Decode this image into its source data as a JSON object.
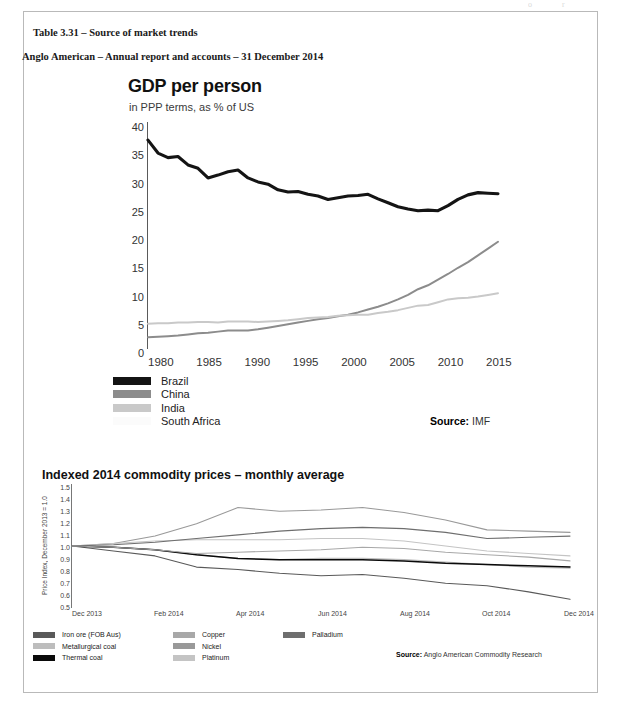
{
  "page": {
    "top_faint_marks": "o  r",
    "caption_table": "Table 3.31 – Source of market trends",
    "caption_report": "Anglo American – Annual report and accounts – 31 December 2014"
  },
  "gdp_chart": {
    "title": "GDP per person",
    "subtitle": "in PPP terms, as % of US",
    "source_label": "Source:",
    "source_value": "IMF",
    "legend": [
      {
        "label": "Brazil",
        "color": "#141414"
      },
      {
        "label": "China",
        "color": "#8c8c8c"
      },
      {
        "label": "India",
        "color": "#c9c9c9"
      },
      {
        "label": "South Africa",
        "color": "#fbfbfb"
      }
    ]
  },
  "commodity_chart": {
    "title": "Indexed 2014 commodity prices – monthly average",
    "ylabel": "Price Index, December 2013 = 1.0",
    "source_label": "Source:",
    "source_value": "Anglo American Commodity Research",
    "legend_col1": [
      {
        "label": "Iron ore (FOB Aus)",
        "color": "#595959"
      },
      {
        "label": "Metallurgical coal",
        "color": "#bdbdbd"
      },
      {
        "label": "Thermal coal",
        "color": "#0a0a0a"
      }
    ],
    "legend_col2": [
      {
        "label": "Copper",
        "color": "#a8a8a8"
      },
      {
        "label": "Nickel",
        "color": "#999999"
      },
      {
        "label": "Platinum",
        "color": "#c4c4c4"
      }
    ],
    "legend_col3": [
      {
        "label": "Palladium",
        "color": "#6e6e6e"
      }
    ]
  },
  "chart_data": [
    {
      "type": "line",
      "id": "gdp-per-person",
      "title": "GDP per person",
      "subtitle": "in PPP terms, as % of US",
      "xlabel": "",
      "ylabel": "% of US (PPP terms)",
      "ylim": [
        0,
        40
      ],
      "yticks": [
        0,
        5,
        10,
        15,
        20,
        25,
        30,
        35,
        40
      ],
      "xlim": [
        1980,
        2015
      ],
      "xticks": [
        1980,
        1985,
        1990,
        1995,
        2000,
        2005,
        2010,
        2015
      ],
      "grid": false,
      "legend_position": "below-left",
      "source": "IMF",
      "x": [
        1980,
        1981,
        1982,
        1983,
        1984,
        1985,
        1986,
        1987,
        1988,
        1989,
        1990,
        1991,
        1992,
        1993,
        1994,
        1995,
        1996,
        1997,
        1998,
        1999,
        2000,
        2001,
        2002,
        2003,
        2004,
        2005,
        2006,
        2007,
        2008,
        2009,
        2010,
        2011,
        2012,
        2013,
        2014,
        2015
      ],
      "series": [
        {
          "name": "Brazil",
          "color": "#141414",
          "values": [
            36.8,
            34.5,
            33.7,
            33.9,
            32.4,
            31.8,
            30.1,
            30.6,
            31.2,
            31.5,
            30.1,
            29.4,
            29.0,
            28.0,
            27.6,
            27.7,
            27.2,
            26.9,
            26.3,
            26.6,
            26.9,
            27.0,
            27.2,
            26.4,
            25.7,
            25.0,
            24.6,
            24.3,
            24.4,
            24.3,
            25.2,
            26.3,
            27.1,
            27.5,
            27.4,
            27.3
          ]
        },
        {
          "name": "China",
          "color": "#8c8c8c",
          "values": [
            1.9,
            2.0,
            2.1,
            2.2,
            2.4,
            2.6,
            2.7,
            2.9,
            3.1,
            3.1,
            3.1,
            3.3,
            3.6,
            3.9,
            4.2,
            4.5,
            4.8,
            5.1,
            5.3,
            5.6,
            5.9,
            6.3,
            6.8,
            7.3,
            7.9,
            8.6,
            9.4,
            10.4,
            11.1,
            12.1,
            13.1,
            14.2,
            15.2,
            16.4,
            17.6,
            18.8
          ]
        },
        {
          "name": "India",
          "color": "#c9c9c9",
          "values": [
            4.3,
            4.4,
            4.4,
            4.5,
            4.5,
            4.6,
            4.6,
            4.5,
            4.7,
            4.7,
            4.7,
            4.6,
            4.7,
            4.8,
            4.9,
            5.1,
            5.3,
            5.4,
            5.5,
            5.7,
            5.8,
            5.9,
            5.9,
            6.2,
            6.4,
            6.7,
            7.1,
            7.5,
            7.6,
            8.1,
            8.6,
            8.8,
            8.9,
            9.1,
            9.4,
            9.7
          ]
        },
        {
          "name": "South Africa",
          "color": "#fbfbfb",
          "values": [
            null,
            null,
            null,
            null,
            null,
            null,
            null,
            null,
            null,
            null,
            null,
            null,
            null,
            null,
            null,
            null,
            null,
            null,
            null,
            null,
            null,
            null,
            null,
            null,
            null,
            null,
            null,
            null,
            null,
            null,
            null,
            null,
            null,
            null,
            null,
            null
          ]
        }
      ]
    },
    {
      "type": "line",
      "id": "indexed-2014-commodity-prices",
      "title": "Indexed 2014 commodity prices – monthly average",
      "xlabel": "",
      "ylabel": "Price Index, December 2013 = 1.0",
      "ylim": [
        0.5,
        1.5
      ],
      "yticks": [
        0.5,
        0.6,
        0.7,
        0.8,
        0.9,
        1.0,
        1.1,
        1.2,
        1.3,
        1.4,
        1.5
      ],
      "xticks": [
        "Dec 2013",
        "Feb 2014",
        "Apr 2014",
        "Jun 2014",
        "Aug 2014",
        "Oct 2014",
        "Dec 2014"
      ],
      "x": [
        "Dec 2013",
        "Jan 2014",
        "Feb 2014",
        "Mar 2014",
        "Apr 2014",
        "May 2014",
        "Jun 2014",
        "Jul 2014",
        "Aug 2014",
        "Sep 2014",
        "Oct 2014",
        "Nov 2014",
        "Dec 2014"
      ],
      "grid": false,
      "legend_position": "below-left",
      "source": "Anglo American Commodity Research",
      "series": [
        {
          "name": "Iron ore (FOB Aus)",
          "color": "#595959",
          "values": [
            1.0,
            0.96,
            0.92,
            0.83,
            0.81,
            0.78,
            0.76,
            0.77,
            0.74,
            0.7,
            0.68,
            0.63,
            0.57
          ]
        },
        {
          "name": "Metallurgical coal",
          "color": "#bdbdbd",
          "values": [
            1.0,
            0.99,
            0.97,
            0.93,
            0.9,
            0.89,
            0.9,
            0.9,
            0.89,
            0.87,
            0.85,
            0.83,
            0.82
          ]
        },
        {
          "name": "Thermal coal",
          "color": "#0a0a0a",
          "values": [
            1.0,
            0.99,
            0.97,
            0.93,
            0.9,
            0.89,
            0.89,
            0.89,
            0.88,
            0.86,
            0.85,
            0.84,
            0.83
          ]
        },
        {
          "name": "Copper",
          "color": "#a8a8a8",
          "values": [
            1.0,
            0.99,
            0.97,
            0.94,
            0.95,
            0.96,
            0.97,
            0.99,
            0.98,
            0.95,
            0.93,
            0.91,
            0.88
          ]
        },
        {
          "name": "Nickel",
          "color": "#999999",
          "values": [
            1.0,
            1.02,
            1.08,
            1.18,
            1.31,
            1.28,
            1.29,
            1.31,
            1.27,
            1.21,
            1.13,
            1.12,
            1.11
          ]
        },
        {
          "name": "Platinum",
          "color": "#c4c4c4",
          "values": [
            1.0,
            1.02,
            1.04,
            1.05,
            1.05,
            1.05,
            1.06,
            1.06,
            1.04,
            1.0,
            0.96,
            0.94,
            0.92
          ]
        },
        {
          "name": "Palladium",
          "color": "#6e6e6e",
          "values": [
            1.0,
            1.01,
            1.03,
            1.06,
            1.09,
            1.12,
            1.14,
            1.15,
            1.14,
            1.11,
            1.06,
            1.07,
            1.08
          ]
        }
      ]
    }
  ]
}
